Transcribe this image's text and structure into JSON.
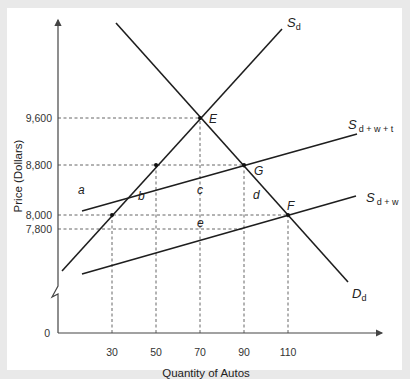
{
  "chart_data": {
    "type": "line",
    "title": "",
    "xlabel": "Quantity of Autos",
    "ylabel": "Price (Dollars)",
    "x_ticks": [
      "30",
      "50",
      "70",
      "90",
      "110"
    ],
    "y_ticks": [
      "9,600",
      "8,800",
      "8,000",
      "7,800"
    ],
    "origin_label": "0",
    "y_axis_break": true,
    "grid": false,
    "series": [
      {
        "name": "S_d",
        "label_main": "S",
        "label_sub": "d",
        "points": [
          [
            30,
            8000
          ],
          [
            50,
            8800
          ],
          [
            70,
            9600
          ]
        ]
      },
      {
        "name": "D_d",
        "label_main": "D",
        "label_sub": "d",
        "points": [
          [
            70,
            9600
          ],
          [
            90,
            8800
          ],
          [
            110,
            8000
          ]
        ]
      },
      {
        "name": "S_d+w+t",
        "label_main": "S",
        "label_sub": "d + w + t",
        "points": [
          [
            90,
            8800
          ]
        ]
      },
      {
        "name": "S_d+w",
        "label_main": "S",
        "label_sub": "d + w",
        "points": [
          [
            110,
            8000
          ]
        ]
      }
    ],
    "points": [
      {
        "label": "E",
        "x": 70,
        "y": 9600
      },
      {
        "label": "G",
        "x": 90,
        "y": 8800
      },
      {
        "label": "F",
        "x": 110,
        "y": 8000
      }
    ],
    "area_labels": [
      "a",
      "b",
      "c",
      "d",
      "e"
    ],
    "guides": {
      "horizontal": [
        {
          "y": 9600,
          "to_x": 70
        },
        {
          "y": 8800,
          "to_x": 90
        },
        {
          "y": 8000,
          "to_x": 110
        },
        {
          "y": 7800,
          "to_x": 90
        }
      ],
      "vertical": [
        {
          "x": 30,
          "to_y": 8000
        },
        {
          "x": 50,
          "to_y": 8800
        },
        {
          "x": 70,
          "to_y": 9600
        },
        {
          "x": 90,
          "to_y": 8800
        },
        {
          "x": 110,
          "to_y": 8000
        }
      ]
    }
  }
}
